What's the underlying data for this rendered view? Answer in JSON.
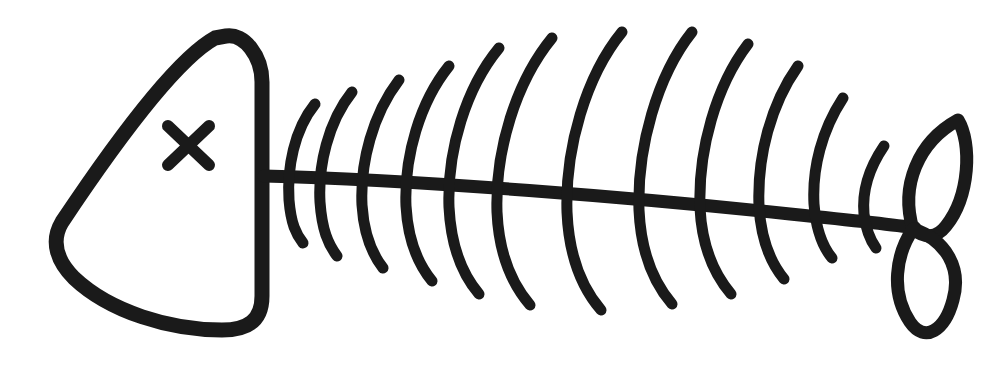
{
  "artwork": {
    "title": "Fish bone skeleton line drawing",
    "subject": "fish-skeleton",
    "style": "hand-drawn monochrome outline",
    "background_color": "#ffffff",
    "stroke_color": "#1a1a1a",
    "canvas": {
      "width": 999,
      "height": 367
    },
    "orientation": "head on the left, tail on the right"
  },
  "parts": {
    "head": {
      "name": "Head",
      "shape": "rounded triangle",
      "stroke_width": 15,
      "path": "M 215 38 C 175 60, 110 150, 62 222 C 50 242, 58 262, 74 278 C 110 312, 170 330, 222 330 C 248 330, 262 320, 262 296 L 262 82 C 262 56, 244 33, 226 36 Z",
      "vertices": {
        "top": [
          215,
          38
        ],
        "nose": [
          58,
          232
        ],
        "bottom_right": [
          255,
          322
        ],
        "top_right": [
          262,
          80
        ]
      }
    },
    "eye": {
      "name": "X eye",
      "symbol": "x",
      "stroke_width": 12,
      "center": [
        188,
        145
      ],
      "size": 44,
      "strokes": [
        "M 168 126 L 209 165",
        "M 209 126 L 168 165"
      ]
    },
    "spine": {
      "name": "Spine",
      "stroke_width": 13,
      "path": "M 264 176 C 420 180, 640 198, 790 214 C 850 220, 890 224, 915 228",
      "start": [
        264,
        176
      ],
      "end": [
        915,
        228
      ]
    },
    "ribs": {
      "name": "Ribs",
      "count": 12,
      "stroke_width": 11,
      "paths": [
        "M 315 104 C 294 130, 287 168, 289 200 C 291 224, 296 234, 303 243",
        "M 352 92 C 328 122, 318 166, 320 202 C 322 230, 328 244, 337 256",
        "M 399 80 C 373 114, 360 162, 362 205 C 364 236, 372 254, 383 268",
        "M 449 66 C 420 102, 404 156, 406 206 C 408 242, 418 264, 432 281",
        "M 499 48 C 466 88, 447 150, 449 207 C 451 248, 462 274, 479 294",
        "M 552 38 C 516 82, 495 150, 497 212 C 499 256, 512 284, 530 305",
        "M 622 32 C 586 76, 565 148, 567 212 C 569 258, 582 288, 601 310",
        "M 692 32 C 657 76, 637 148, 639 210 C 641 254, 654 283, 672 304",
        "M 748 44 C 716 86, 698 150, 700 208 C 702 248, 714 274, 731 294",
        "M 798 66 C 771 104, 757 156, 759 206 C 761 240, 770 262, 784 279",
        "M 843 98 C 822 130, 812 168, 814 204 C 816 230, 822 246, 832 258",
        "M 884 146 C 869 168, 862 192, 864 214 C 866 230, 870 240, 876 248"
      ]
    },
    "tail": {
      "name": "Tail",
      "shape": "two crossing leaf lobes (figure-eight)",
      "stroke_width": 13,
      "crossing_point": [
        913,
        229
      ],
      "upper_lobe": {
        "path": "M 913 229 C 900 186, 918 142, 958 120 C 972 143, 970 196, 946 226 C 936 239, 924 238, 913 229 Z",
        "tip": [
          960,
          121
        ]
      },
      "lower_lobe": {
        "path": "M 913 229 C 896 254, 890 292, 910 322 C 925 344, 945 330, 953 300 C 962 268, 946 240, 913 229 Z",
        "tip": [
          936,
          331
        ]
      }
    }
  }
}
